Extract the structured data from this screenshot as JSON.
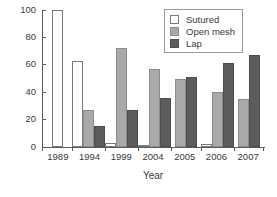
{
  "chart_data": {
    "type": "bar",
    "title": "",
    "xlabel": "Year",
    "ylabel": "Percentage",
    "categories": [
      "1989",
      "1994",
      "1999",
      "2004",
      "2005",
      "2006",
      "2007"
    ],
    "series": [
      {
        "name": "Sutured",
        "color": "#ffffff",
        "values": [
          100,
          63,
          3,
          1,
          0,
          2,
          0
        ]
      },
      {
        "name": "Open mesh",
        "color": "#a9a9a9",
        "values": [
          0,
          27,
          72,
          57,
          50,
          40,
          35
        ]
      },
      {
        "name": "Lap",
        "color": "#5c5c5c",
        "values": [
          0,
          15,
          27,
          36,
          51,
          61,
          67
        ]
      }
    ],
    "ylim": [
      0,
      100
    ],
    "yticks": [
      0,
      20,
      40,
      60,
      80,
      100
    ],
    "ytick_labels": [
      "0",
      "20",
      "40",
      "60",
      "80",
      "100"
    ],
    "grid": false,
    "legend_position": "top-right",
    "legend_entries": [
      "Sutured",
      "Open mesh",
      "Lap"
    ]
  }
}
